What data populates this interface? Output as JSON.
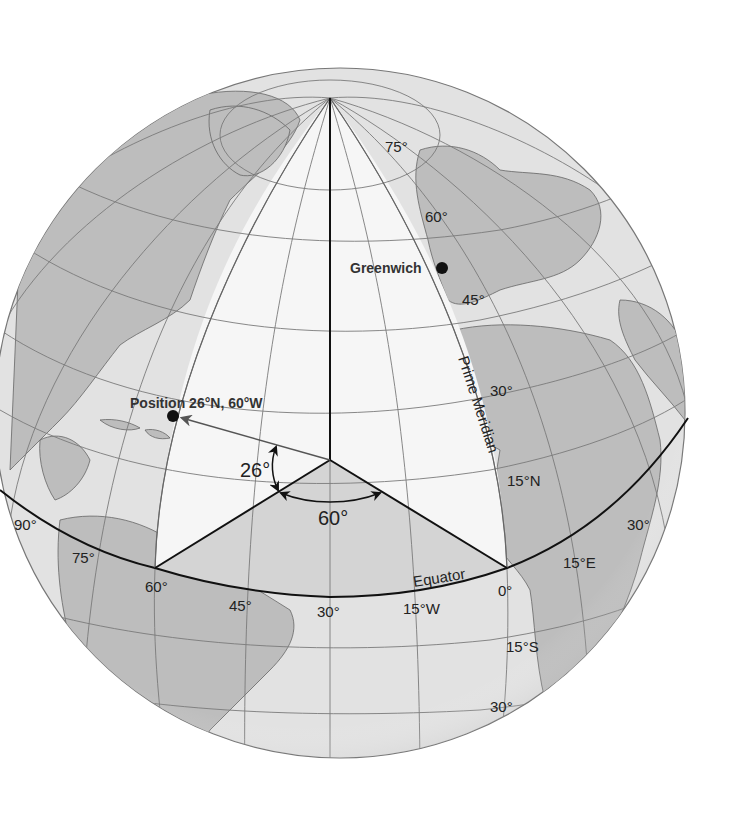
{
  "colors": {
    "background": "#ffffff",
    "ocean": "#e2e2e2",
    "land": "#bdbdbd",
    "wedge_white": "#f6f6f6",
    "wedge_gray": "#cfcfcf",
    "grid": "#7a7a7a",
    "line": "#111111",
    "text": "#222222"
  },
  "diagram": {
    "points": {
      "greenwich": {
        "label": "Greenwich"
      },
      "position": {
        "label": "Position 26°N, 60°W"
      }
    },
    "lines": {
      "prime_meridian": "Prime Meridian",
      "equator": "Equator"
    },
    "angles": {
      "latitude": "26°",
      "longitude": "60°"
    },
    "latitude_labels": {
      "n75": "75°",
      "n60": "60°",
      "n45": "45°",
      "n30": "30°",
      "n15": "15°N",
      "s15": "15°S",
      "s30": "30°"
    },
    "longitude_labels": {
      "w90": "90°",
      "w75": "75°",
      "w60": "60°",
      "w45": "45°",
      "w30": "30°",
      "w15": "15°W",
      "zero": "0°",
      "e15": "15°E",
      "e30": "30°"
    }
  }
}
